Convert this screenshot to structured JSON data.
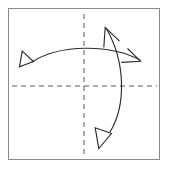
{
  "page": {
    "width": 169,
    "height": 169,
    "background_color": "#ffffff"
  },
  "colors": {
    "frame_stroke": "#8a8a8a",
    "dash_stroke": "#5a5a5a",
    "curve_stroke": "#2b2b2b",
    "arrowhead_stroke": "#2b2b2b",
    "arrowhead_fill": "none",
    "canvas": "#ffffff"
  },
  "frame": {
    "label": "diagram-border",
    "x": 8.5,
    "y": 8.5,
    "width": 151,
    "height": 151,
    "stroke_width": 1
  },
  "crosshair": {
    "label": "dashed-reference-axes",
    "vertical": {
      "label": "vertical-dashed-axis",
      "x": 84,
      "y1": 14,
      "y2": 156,
      "dash_pattern": "5 4",
      "stroke_width": 1
    },
    "horizontal": {
      "label": "horizontal-dashed-axis",
      "y": 86,
      "x1": 12,
      "x2": 157,
      "dash_pattern": "5 4",
      "stroke_width": 1
    }
  },
  "chart_data": {
    "type": "diagram",
    "elements": [
      {
        "name": "horizontal-curved-arrow",
        "description": "Double headed arc bulging upward spanning left to right across the frame",
        "path": "M 32 62 C 60 44, 110 44, 140 60",
        "start_point": [
          32,
          62
        ],
        "end_point": [
          140,
          60
        ],
        "control_points": [
          [
            60,
            44
          ],
          [
            110,
            44
          ]
        ],
        "heads": [
          "left-barbed-arrowhead",
          "right-chevron-arrowhead"
        ]
      },
      {
        "name": "vertical-curved-arrow",
        "description": "Double headed arc bulging rightward spanning top to bottom of the frame",
        "path": "M 106 28 C 126 62, 126 106, 110 132",
        "start_point": [
          106,
          28
        ],
        "end_point": [
          110,
          132
        ],
        "control_points": [
          [
            126,
            62
          ],
          [
            126,
            106
          ]
        ],
        "heads": [
          "top-chevron-arrowhead",
          "bottom-barbed-arrowhead"
        ]
      }
    ],
    "arrowheads": [
      {
        "name": "left-barbed-arrowhead",
        "points": "33.5 61.5, 19 66.5, 21.5 51.5",
        "style": "open-barbed",
        "direction": "left"
      },
      {
        "name": "right-chevron-arrowhead",
        "points": "139.5 60.5, 121.5 62.5, 127.5 48.5",
        "style": "open-chevron",
        "direction": "right-down"
      },
      {
        "name": "top-chevron-arrowhead",
        "points": "105.5 28.5, 103.5 46.5, 118 40",
        "style": "open-chevron",
        "direction": "up-left"
      },
      {
        "name": "bottom-barbed-arrowhead",
        "points": "110.5 132.5, 95.5 128.5, 98.5 147",
        "style": "open-barbed",
        "direction": "down-right"
      }
    ],
    "axis_ranges": {
      "x": [
        0,
        169
      ],
      "y": [
        0,
        169
      ]
    },
    "grid": false,
    "legend": null,
    "annotations": []
  }
}
